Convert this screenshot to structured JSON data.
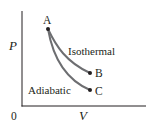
{
  "diagram": {
    "type": "pv-diagram",
    "axes": {
      "y_label": "P",
      "x_label": "V",
      "origin_label": "0"
    },
    "points": [
      {
        "id": "A",
        "label": "A"
      },
      {
        "id": "B",
        "label": "B"
      },
      {
        "id": "C",
        "label": "C"
      }
    ],
    "curves": [
      {
        "id": "isothermal",
        "label": "Isothermal",
        "from": "A",
        "to": "B"
      },
      {
        "id": "adiabatic",
        "label": "Adiabatic",
        "from": "A",
        "to": "C"
      }
    ],
    "colors": {
      "axis": "#231f20",
      "curve": "#6d6e71",
      "point": "#231f20",
      "text": "#231f20"
    }
  }
}
